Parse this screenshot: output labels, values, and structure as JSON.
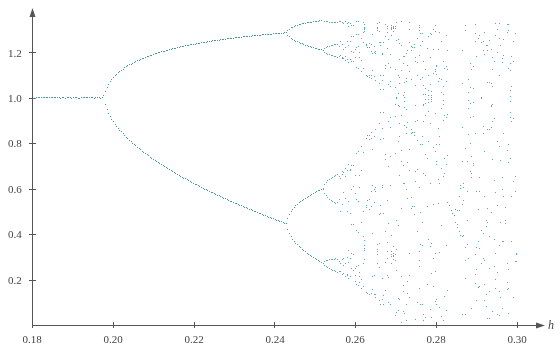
{
  "chart_data": {
    "type": "scatter",
    "title": "",
    "xlabel": "h",
    "ylabel": "",
    "xlim": [
      0.18,
      0.3
    ],
    "ylim": [
      0.0,
      1.35
    ],
    "grid": false,
    "legend": null,
    "x_ticks": [
      "0.18",
      "0.20",
      "0.22",
      "0.24",
      "0.26",
      "0.28",
      "0.30"
    ],
    "y_ticks": [
      "0.2",
      "0.4",
      "0.6",
      "0.8",
      "1.0",
      "1.2"
    ],
    "series": [
      {
        "name": "bifurcation",
        "color": "#3f9e96",
        "description": "Period-doubling bifurcation diagram: single fixed point at 1.0 for h<0.198, period-2 branches diverging to ~1.20 and ~0.64 by h=0.243, period-4 up to ~0.252, then chaotic band widening to [~0.0, ~1.33] at h=0.30",
        "key_points": [
          {
            "h": 0.18,
            "y": [
              1.0
            ]
          },
          {
            "h": 0.198,
            "y": [
              1.0
            ]
          },
          {
            "h": 0.22,
            "y": [
              1.15,
              0.82
            ]
          },
          {
            "h": 0.243,
            "y": [
              1.2,
              0.64
            ]
          },
          {
            "h": 0.252,
            "y": [
              1.235,
              1.16,
              0.74,
              0.52
            ]
          },
          {
            "h": 0.27,
            "y_range": [
              0.35,
              1.27
            ]
          },
          {
            "h": 0.28,
            "y_range": [
              0.2,
              1.29
            ]
          },
          {
            "h": 0.3,
            "y_range": [
              0.0,
              1.33
            ]
          }
        ]
      }
    ]
  },
  "axes": {
    "x_name": "h"
  }
}
